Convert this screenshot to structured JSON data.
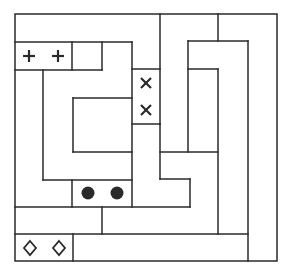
{
  "puzzle": {
    "type": "sliding-block-puzzle",
    "colors": {
      "line": "#2a2a2a",
      "background": "#ffffff",
      "dot": "#2a2a2a"
    },
    "pieces": [
      {
        "id": "plus-piece",
        "symbol": "plus-icon",
        "glyph": "+",
        "count": 2,
        "x": 15,
        "y": 42,
        "w": 57,
        "h": 28
      },
      {
        "id": "cross-piece",
        "symbol": "cross-icon",
        "glyph": "×",
        "count": 2,
        "x": 132,
        "y": 69,
        "w": 28,
        "h": 55
      },
      {
        "id": "dot-piece",
        "symbol": "filled-circle-icon",
        "glyph": "●",
        "count": 2,
        "x": 72,
        "y": 180,
        "w": 60,
        "h": 27
      },
      {
        "id": "diamond-piece",
        "symbol": "diamond-icon",
        "glyph": "◇",
        "count": 2,
        "x": 15,
        "y": 234,
        "w": 58,
        "h": 27
      }
    ]
  }
}
